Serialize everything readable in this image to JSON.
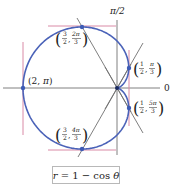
{
  "figure": {
    "caption": "r = 1 − cos θ",
    "equation": "r = 1 - cos θ",
    "axis_labels": {
      "polar_axis": "0",
      "vertical_axis": "π/2"
    },
    "points": [
      {
        "label": "(2, π)",
        "r": "2",
        "theta": "π"
      },
      {
        "label": "(3/2, 2π/3)",
        "r_num": "3",
        "r_den": "2",
        "theta_num": "2π",
        "theta_den": "3"
      },
      {
        "label": "(1/2, π/3)",
        "r_num": "1",
        "r_den": "2",
        "theta_num": "π",
        "theta_den": "3"
      },
      {
        "label": "(1/2, 5π/3)",
        "r_num": "1",
        "r_den": "2",
        "theta_num": "5π",
        "theta_den": "3"
      },
      {
        "label": "(3/2, 4π/3)",
        "r_num": "3",
        "r_den": "2",
        "theta_num": "4π",
        "theta_den": "3"
      }
    ],
    "colors": {
      "curve": "#4a62b8",
      "tangent": "#d98aa6",
      "axis": "#808080",
      "line": "#707070",
      "point": "#3d5bb5"
    }
  }
}
